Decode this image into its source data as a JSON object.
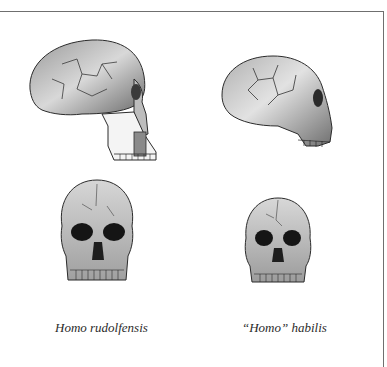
{
  "figure": {
    "panels": [
      {
        "species": "Homo rudolfensis",
        "view": "lateral"
      },
      {
        "species": "\"Homo\" habilis",
        "view": "lateral"
      },
      {
        "species": "Homo rudolfensis",
        "view": "frontal"
      },
      {
        "species": "\"Homo\" habilis",
        "view": "frontal"
      }
    ],
    "captions": {
      "left": "Homo rudolfensis",
      "right": "“Homo” habilis"
    }
  },
  "colors": {
    "frame": "#6f6f6f",
    "ink": "#2b2b2b",
    "shade": "#8a8a8a",
    "dark": "#151515"
  }
}
